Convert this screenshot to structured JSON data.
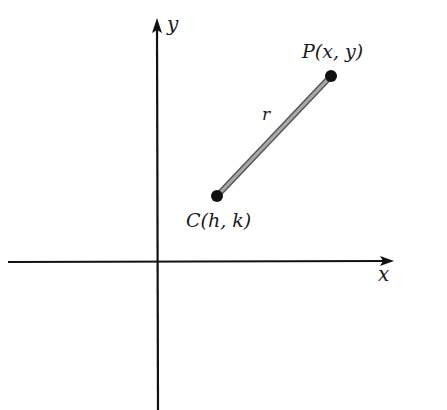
{
  "diagram": {
    "axes": {
      "x_label": "x",
      "y_label": "y"
    },
    "points": [
      {
        "id": "P",
        "label": "P(x, y)"
      },
      {
        "id": "C",
        "label": "C(h, k)"
      }
    ],
    "segment": {
      "from": "C",
      "to": "P",
      "label": "r"
    },
    "colors": {
      "axis": "#111111",
      "segment": "#8a8a8a",
      "point": "#111111",
      "text": "#1a1a1a"
    }
  }
}
